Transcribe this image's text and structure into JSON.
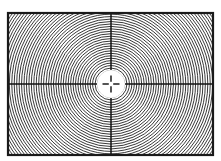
{
  "figure": {
    "type": "test-target",
    "canvas": {
      "width": 221,
      "height": 161
    },
    "background_color": "#ffffff"
  },
  "frame": {
    "x": 8,
    "y": 13,
    "width": 205,
    "height": 142,
    "stroke_color": "#1a1a1a",
    "stroke_width": 2.2,
    "fill_color": "#ffffff"
  },
  "rings": {
    "center_x": 111,
    "center_y": 84,
    "spacing": 2.45,
    "count": 52,
    "start_radius": 13.5,
    "stroke_color": "#151515",
    "stroke_width": 0.85,
    "description": "concentric circles clipped to frame"
  },
  "axes": {
    "stroke_color": "#101010",
    "stroke_width": 1.5,
    "horizontal": {
      "y": 84,
      "x1": 8,
      "x2": 213
    },
    "vertical": {
      "x": 111,
      "y1": 13,
      "y2": 155
    }
  },
  "center_disc": {
    "cx": 111,
    "cy": 84,
    "r": 13.5,
    "fill_color": "#ffffff",
    "stroke_color": "#ffffff"
  },
  "crosshair": {
    "cx": 111,
    "cy": 84,
    "arm_length": 8.5,
    "stroke_color": "#2b2b2b",
    "stroke_width": 1.6,
    "gap": 2.2,
    "description": "thin plus mark at pattern center"
  },
  "chart_data": {
    "type": "scatter",
    "xlabel": "",
    "ylabel": "",
    "categories": [],
    "values": [],
    "grid": false,
    "legend_position": "none",
    "annotations": [
      "center crosshair",
      "white central disc",
      "horizontal axis line",
      "vertical axis line",
      "rectangular border frame"
    ]
  }
}
